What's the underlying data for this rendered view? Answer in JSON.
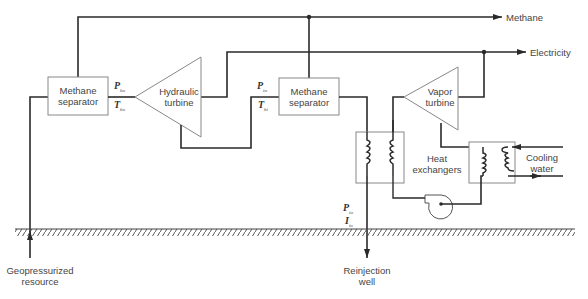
{
  "diagram": {
    "components": {
      "separator_1": {
        "line1": "Methane",
        "line2": "separator"
      },
      "hydraulic_turbine": {
        "line1": "Hydraulic",
        "line2": "turbine"
      },
      "separator_2": {
        "line1": "Methane",
        "line2": "separator"
      },
      "vapor_turbine": {
        "line1": "Vapor",
        "line2": "turbine"
      },
      "heat_exchangers": {
        "line1": "Heat",
        "line2": "exchangers"
      },
      "cooling_water": {
        "line1": "Cooling",
        "line2": "water"
      }
    },
    "outputs": {
      "methane": "Methane",
      "electricity": "Electricity"
    },
    "sources": {
      "geopressurized": {
        "line1": "Geopressurized",
        "line2": "resource"
      },
      "reinjection": {
        "line1": "Reinjection",
        "line2": "well"
      }
    },
    "variables": {
      "p1": {
        "sym": "P",
        "sub": "ho"
      },
      "t1": {
        "sym": "T",
        "sub": "ho"
      },
      "p2": {
        "sym": "P",
        "sub": "io"
      },
      "t2": {
        "sym": "T",
        "sub": "hi"
      },
      "p3": {
        "sym": "P",
        "sub": "io"
      },
      "t3": {
        "sym": "I",
        "sub": "io"
      }
    },
    "colors": {
      "line": "#2a2a2a",
      "box": "#888888"
    }
  }
}
